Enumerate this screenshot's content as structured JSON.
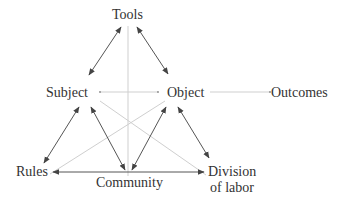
{
  "diagram": {
    "type": "activity-system-triangle",
    "nodes": {
      "tools": "Tools",
      "subject": "Subject",
      "object": "Object",
      "outcomes": "Outcomes",
      "rules": "Rules",
      "community": "Community",
      "division_line1": "Division",
      "division_line2": "of labor"
    },
    "edges": [
      {
        "from": "Tools",
        "to": "Subject",
        "style": "double-arrow"
      },
      {
        "from": "Tools",
        "to": "Object",
        "style": "double-arrow"
      },
      {
        "from": "Subject",
        "to": "Rules",
        "style": "double-arrow"
      },
      {
        "from": "Subject",
        "to": "Community",
        "style": "double-arrow"
      },
      {
        "from": "Object",
        "to": "Community",
        "style": "double-arrow"
      },
      {
        "from": "Object",
        "to": "Division of labor",
        "style": "double-arrow"
      },
      {
        "from": "Rules",
        "to": "Community",
        "style": "arrow"
      },
      {
        "from": "Community",
        "to": "Division of labor",
        "style": "arrow"
      },
      {
        "from": "Subject",
        "to": "Object",
        "style": "light-line"
      },
      {
        "from": "Object",
        "to": "Outcomes",
        "style": "light-line"
      },
      {
        "from": "Tools",
        "to": "Community",
        "style": "light-line"
      },
      {
        "from": "Subject",
        "to": "Division of labor",
        "style": "light-line"
      },
      {
        "from": "Object",
        "to": "Rules",
        "style": "light-line"
      }
    ],
    "colors": {
      "text": "#333333",
      "arrow": "#555555",
      "light_line": "#cfcfcf"
    }
  }
}
